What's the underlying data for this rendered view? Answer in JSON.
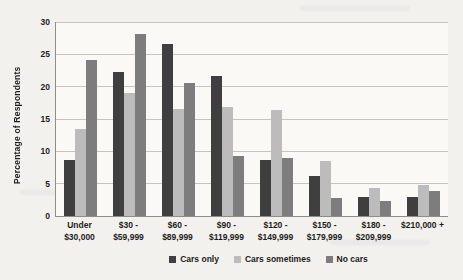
{
  "chart_data": {
    "type": "bar",
    "title": "",
    "xlabel": "",
    "ylabel": "Percentage of Respondents",
    "ylim": [
      0,
      30
    ],
    "yticks": [
      0,
      5,
      10,
      15,
      20,
      25,
      30
    ],
    "grid": true,
    "legend_position": "bottom",
    "categories": [
      "Under\n$30,000",
      "$30 -\n$59,999",
      "$60 -\n$89,999",
      "$90 -\n$119,999",
      "$120 -\n$149,999",
      "$150 -\n$179,999",
      "$180 -\n$209,999",
      "$210,000 +"
    ],
    "series": [
      {
        "name": "Cars only",
        "color": "#3f3f3f",
        "values": [
          8.7,
          22.3,
          26.6,
          21.7,
          8.7,
          6.2,
          3.0,
          3.0
        ]
      },
      {
        "name": "Cars sometimes",
        "color": "#bcbcbc",
        "values": [
          13.4,
          19.1,
          16.5,
          16.9,
          16.4,
          8.5,
          4.4,
          4.8
        ]
      },
      {
        "name": "No cars",
        "color": "#7d7d7d",
        "values": [
          24.2,
          28.2,
          20.5,
          9.3,
          9.0,
          2.8,
          2.3,
          3.8
        ]
      }
    ]
  },
  "colors": {
    "page_background": "#f3f1ed",
    "plot_background": "#faf9f6",
    "gridline": "#c6c4bf",
    "axis_line": "#8f8d89",
    "text": "#1c1c1c"
  }
}
